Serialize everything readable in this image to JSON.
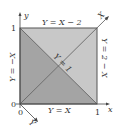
{
  "diagram": {
    "type": "unit-square-transformation",
    "colors": {
      "light_region": "#c8c8c8",
      "dark_region": "#a4a4a4",
      "edge": "#555555",
      "axis": "#444444",
      "text": "#333333"
    },
    "axes": {
      "x_label": "x",
      "y_label": "y",
      "X_label": "X",
      "Y_label": "Y"
    },
    "ticks": {
      "origin_y": "0",
      "origin_x": "0",
      "y_one": "1",
      "x_one": "1"
    },
    "edge_labels": {
      "top": "Y = X − 2",
      "right": "Y = 2 − X",
      "left": "Y = −X",
      "bottom": "Y = X",
      "diagonal": "Y = 1"
    }
  }
}
